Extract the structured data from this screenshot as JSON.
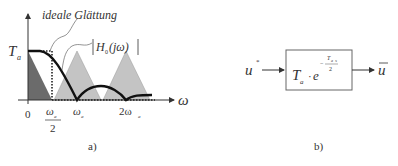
{
  "panel_a": {
    "caption": "a)",
    "y_label_main": "T",
    "y_label_sub": "a",
    "x_axis_label": "ω",
    "annotation_ideal": "ideale  Glättung",
    "annotation_H_pre": "H",
    "annotation_H_sub": "0",
    "annotation_H_post": "(jω)",
    "ticks": [
      {
        "main": "0"
      },
      {
        "main": "ω",
        "sub": "a",
        "denominator": "2"
      },
      {
        "main": "ω",
        "sub": "a"
      },
      {
        "main": "2ω",
        "sub": "a"
      }
    ],
    "colors": {
      "baseband_triangle": "#6b6b6b",
      "image_triangles": "#c4c4c4",
      "curve": "#111111"
    }
  },
  "panel_b": {
    "caption": "b)",
    "input_main": "u",
    "input_sup": "*",
    "block_main": "T",
    "block_sub": "a",
    "block_dot": "·",
    "block_exp_base": "e",
    "block_exp_num": "T",
    "block_exp_num_sub": "a",
    "block_exp_s": "s",
    "block_exp_den": "2",
    "block_exp_sign": "−",
    "output_main": "u"
  }
}
